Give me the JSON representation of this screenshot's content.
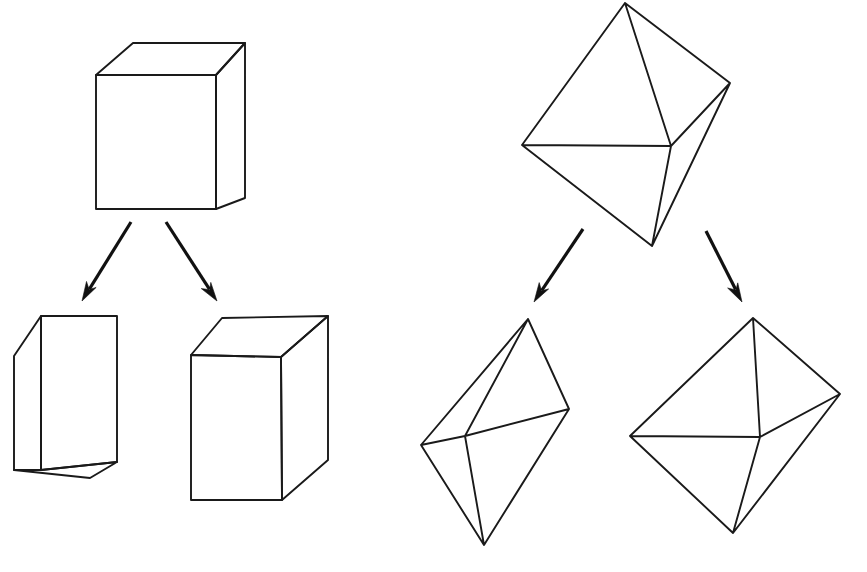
{
  "figure": {
    "background_color": "#ffffff",
    "line_color": "#1a1a1a",
    "arrow_color": "#111111",
    "width": 867,
    "height": 572
  },
  "groups": [
    {
      "id": "box-group",
      "name": "Box family",
      "parent_label": "Cube",
      "children_labels": [
        "Narrow box",
        "Tall box"
      ]
    },
    {
      "id": "octahedron-group",
      "name": "Octahedron family",
      "parent_label": "Octahedron",
      "children_labels": [
        "Elongated octahedron",
        "Flattened octahedron"
      ]
    }
  ],
  "shapes": {
    "parent_box": {
      "name": "parent-box",
      "label": "Cube",
      "front": [
        [
          96,
          75
        ],
        [
          216,
          75
        ],
        [
          216,
          209
        ],
        [
          96,
          209
        ]
      ],
      "top": [
        [
          96,
          75
        ],
        [
          133,
          43
        ],
        [
          245,
          43
        ],
        [
          216,
          75
        ]
      ],
      "right": [
        [
          216,
          75
        ],
        [
          245,
          43
        ],
        [
          245,
          198
        ],
        [
          216,
          209
        ]
      ]
    },
    "child_box_narrow": {
      "name": "child-box-narrow",
      "label": "Narrow box",
      "front": [
        [
          41,
          316
        ],
        [
          117,
          316
        ],
        [
          117,
          462
        ],
        [
          41,
          470
        ]
      ],
      "left": [
        [
          41,
          316
        ],
        [
          14,
          356
        ],
        [
          14,
          470
        ],
        [
          41,
          470
        ]
      ],
      "bottom": [
        [
          41,
          470
        ],
        [
          14,
          470
        ],
        [
          90,
          478
        ],
        [
          117,
          462
        ]
      ]
    },
    "child_box_tall": {
      "name": "child-box-tall",
      "label": "Tall box",
      "front": [
        [
          191,
          355
        ],
        [
          281,
          357
        ],
        [
          282,
          500
        ],
        [
          191,
          500
        ]
      ],
      "top": [
        [
          191,
          355
        ],
        [
          222,
          318
        ],
        [
          328,
          316
        ],
        [
          281,
          357
        ]
      ],
      "right": [
        [
          281,
          357
        ],
        [
          328,
          316
        ],
        [
          328,
          460
        ],
        [
          282,
          500
        ]
      ]
    },
    "parent_octahedron": {
      "name": "parent-octahedron",
      "label": "Octahedron",
      "vertices": {
        "top": [
          625,
          3
        ],
        "left": [
          522,
          145
        ],
        "center": [
          671,
          146
        ],
        "right": [
          730,
          83
        ],
        "bottom": [
          652,
          246
        ]
      }
    },
    "child_octahedron_elongated": {
      "name": "child-octahedron-elongated",
      "label": "Elongated octahedron",
      "vertices": {
        "top": [
          528,
          319
        ],
        "left": [
          421,
          445
        ],
        "center": [
          465,
          436
        ],
        "right": [
          569,
          409
        ],
        "bottom": [
          484,
          545
        ]
      }
    },
    "child_octahedron_flat": {
      "name": "child-octahedron-flat",
      "label": "Flattened octahedron",
      "vertices": {
        "top": [
          753,
          318
        ],
        "left": [
          630,
          436
        ],
        "center": [
          760,
          437
        ],
        "right": [
          840,
          394
        ],
        "bottom": [
          733,
          533
        ]
      }
    }
  },
  "arrows": [
    {
      "name": "arrow-box-to-narrow",
      "from": [
        131,
        222
      ],
      "to": [
        82,
        301
      ],
      "direction": "down-left"
    },
    {
      "name": "arrow-box-to-tall",
      "from": [
        166,
        222
      ],
      "to": [
        217,
        301
      ],
      "direction": "down-right"
    },
    {
      "name": "arrow-octahedron-to-elongated",
      "from": [
        583,
        229
      ],
      "to": [
        534,
        302
      ],
      "direction": "down-left"
    },
    {
      "name": "arrow-octahedron-to-flat",
      "from": [
        706,
        231
      ],
      "to": [
        742,
        302
      ],
      "direction": "down-right"
    }
  ]
}
